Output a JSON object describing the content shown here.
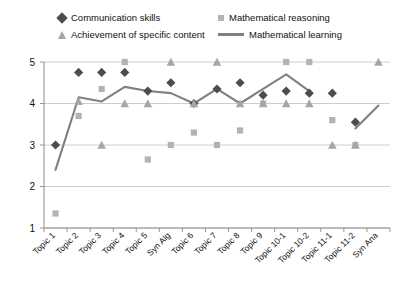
{
  "legend": {
    "entries": [
      {
        "label": "Communication skills",
        "marker": "diamond-marker-icon",
        "color": "#4d4d4d"
      },
      {
        "label": "Mathematical reasoning",
        "marker": "square-marker-icon",
        "color": "#b3b3b3"
      },
      {
        "label": "Achievement of specific content",
        "marker": "triangle-marker-icon",
        "color": "#a6a6a6"
      },
      {
        "label": "Mathematical learning",
        "marker": "line-marker-icon",
        "color": "#808080"
      }
    ]
  },
  "chart_data": {
    "type": "line",
    "title": "",
    "xlabel": "",
    "ylabel": "",
    "ylim": [
      1,
      5
    ],
    "yticks": [
      1,
      2,
      3,
      4,
      5
    ],
    "grid": true,
    "legend_position": "top",
    "categories": [
      "Topic 1",
      "Topic 2",
      "Topic 3",
      "Topic 4",
      "Topic 5",
      "Syn Alg",
      "Topic 6",
      "Topic 7",
      "Topic 8",
      "Topic 9",
      "Topic 10-1",
      "Topic 10-2",
      "Topic 11-1",
      "Topic 11-2",
      "Syn Ana"
    ],
    "series": [
      {
        "name": "Communication skills",
        "marker": "diamond",
        "color": "#4d4d4d",
        "values": [
          3.0,
          4.75,
          4.75,
          4.75,
          4.3,
          4.5,
          4.0,
          4.35,
          4.5,
          4.2,
          4.3,
          4.25,
          4.25,
          3.55,
          null
        ]
      },
      {
        "name": "Mathematical reasoning",
        "marker": "square",
        "color": "#b3b3b3",
        "values": [
          1.35,
          3.7,
          4.35,
          5.0,
          2.65,
          3.0,
          3.3,
          3.0,
          3.35,
          4.0,
          5.0,
          5.0,
          3.6,
          3.0,
          null
        ]
      },
      {
        "name": "Achievement of specific content",
        "marker": "triangle",
        "color": "#a6a6a6",
        "values": [
          null,
          4.05,
          3.0,
          4.0,
          4.0,
          5.0,
          4.0,
          5.0,
          4.0,
          4.0,
          4.0,
          4.0,
          3.0,
          3.0,
          5.0
        ]
      },
      {
        "name": "Mathematical learning",
        "marker": "line",
        "color": "#808080",
        "values": [
          2.4,
          4.15,
          4.05,
          4.4,
          4.3,
          4.25,
          4.0,
          4.35,
          4.0,
          4.35,
          4.7,
          4.3,
          null,
          3.4,
          3.95
        ]
      }
    ]
  }
}
